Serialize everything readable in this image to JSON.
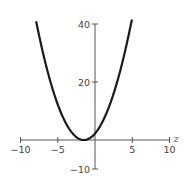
{
  "chart_data": {
    "type": "line",
    "title": "",
    "xlabel": "z",
    "ylabel": "",
    "xlim": [
      -10,
      10
    ],
    "ylim": [
      -10,
      40
    ],
    "grid": false,
    "legend": null,
    "x_ticks": [
      -10,
      -5,
      5,
      10
    ],
    "x_tick_labels": [
      "−10",
      "−5",
      "5",
      "10"
    ],
    "y_ticks": [
      -10,
      20,
      40
    ],
    "y_tick_labels": [
      "−10",
      "20",
      "40"
    ],
    "series": [
      {
        "name": "parabola",
        "expression": "(z + 1.5)^2",
        "x": [
          -7.9,
          -7,
          -6,
          -5,
          -4,
          -3,
          -2,
          -1.5,
          -1,
          0,
          1,
          2,
          3,
          4,
          5
        ],
        "values": [
          40.96,
          30.25,
          20.25,
          12.25,
          6.25,
          2.25,
          0.25,
          0,
          0.25,
          2.25,
          6.25,
          12.25,
          20.25,
          30.25,
          42.25
        ]
      }
    ],
    "colors": {
      "curve": "#1a1a1a",
      "axis": "#555555",
      "text": "#444444"
    }
  }
}
